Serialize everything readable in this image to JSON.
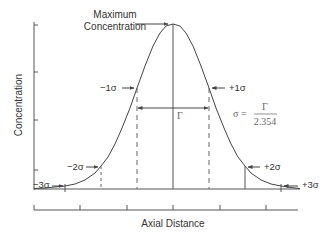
{
  "y_axis": {
    "label": "Concentration"
  },
  "x_axis": {
    "label": "Axial Distance"
  },
  "peak_label": {
    "line1": "Maximum",
    "line2": "Concentration"
  },
  "sigma_markers": [
    {
      "label": "−3σ"
    },
    {
      "label": "−2σ"
    },
    {
      "label": "−1σ"
    },
    {
      "label": "+1σ"
    },
    {
      "label": "+2σ"
    },
    {
      "label": "+3σ"
    }
  ],
  "width_label": "Γ",
  "formula": {
    "lhs": "σ =",
    "numerator": "Γ",
    "denominator": "2.354"
  },
  "colors": {
    "line": "#444444",
    "text": "#333333",
    "formula": "#666666"
  }
}
